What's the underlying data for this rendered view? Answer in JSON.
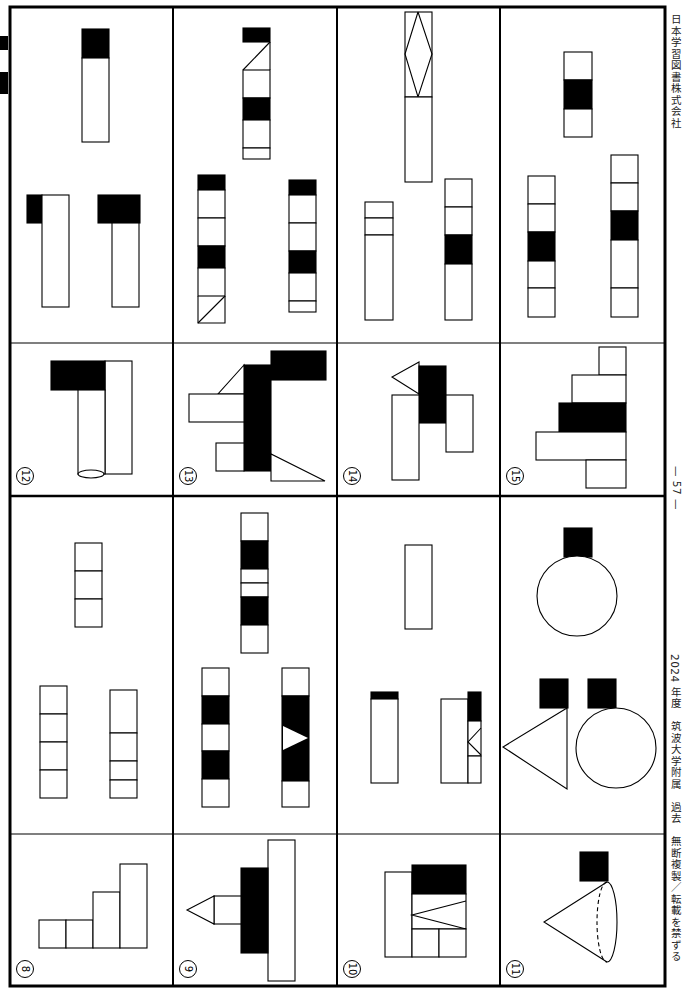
{
  "page": {
    "publisher": "日本学習図書株式会社",
    "page_number": "— 57 —",
    "footer": "2024 年度　筑波大学附属　過去　無断複製／転載を禁ずる",
    "orientation": "rotated 90deg clockwise"
  },
  "colors": {
    "ink": "#000000",
    "paper": "#ffffff",
    "text": "#222222"
  },
  "frame": {
    "x": 10,
    "y": 7,
    "w": 655,
    "h": 979,
    "border": 3
  },
  "grid": {
    "column_dividers_x": [
      173,
      337,
      500
    ],
    "mid_divider_y": 496,
    "sub_dividers": [
      {
        "y": 343,
        "x1": 10,
        "x2": 665
      },
      {
        "y": 834,
        "x1": 10,
        "x2": 665
      }
    ]
  },
  "problems": [
    {
      "number": "⑧",
      "label_x": 16,
      "label_y": 960
    },
    {
      "number": "⑨",
      "label_x": 179,
      "label_y": 960
    },
    {
      "number": "⑩",
      "label_x": 343,
      "label_y": 960
    },
    {
      "number": "⑪",
      "label_x": 506,
      "label_y": 960
    },
    {
      "number": "⑫",
      "label_x": 16,
      "label_y": 467
    },
    {
      "number": "⑬",
      "label_x": 179,
      "label_y": 467
    },
    {
      "number": "⑭",
      "label_x": 343,
      "label_y": 467
    },
    {
      "number": "⑮",
      "label_x": 506,
      "label_y": 467
    }
  ],
  "shapes": [
    {
      "t": "rect",
      "x": 39,
      "y": 920,
      "w": 27,
      "h": 28,
      "f": 0
    },
    {
      "t": "rect",
      "x": 66,
      "y": 920,
      "w": 27,
      "h": 28,
      "f": 0
    },
    {
      "t": "rect",
      "x": 93,
      "y": 892,
      "w": 27,
      "h": 56,
      "f": 0
    },
    {
      "t": "rect",
      "x": 120,
      "y": 864,
      "w": 27,
      "h": 84,
      "f": 0
    },
    {
      "t": "rect",
      "x": 75,
      "y": 543,
      "w": 27,
      "h": 28,
      "f": 0
    },
    {
      "t": "rect",
      "x": 75,
      "y": 571,
      "w": 27,
      "h": 28,
      "f": 0
    },
    {
      "t": "rect",
      "x": 75,
      "y": 599,
      "w": 27,
      "h": 28,
      "f": 0
    },
    {
      "t": "rect",
      "x": 40,
      "y": 686,
      "w": 27,
      "h": 28,
      "f": 0
    },
    {
      "t": "rect",
      "x": 40,
      "y": 714,
      "w": 27,
      "h": 28,
      "f": 0
    },
    {
      "t": "rect",
      "x": 40,
      "y": 742,
      "w": 27,
      "h": 28,
      "f": 0
    },
    {
      "t": "rect",
      "x": 40,
      "y": 770,
      "w": 27,
      "h": 28,
      "f": 0
    },
    {
      "t": "rect",
      "x": 110,
      "y": 690,
      "w": 27,
      "h": 43,
      "f": 0
    },
    {
      "t": "rect",
      "x": 110,
      "y": 733,
      "w": 27,
      "h": 28,
      "f": 0
    },
    {
      "t": "rect",
      "x": 110,
      "y": 761,
      "w": 27,
      "h": 19,
      "f": 0
    },
    {
      "t": "rect",
      "x": 110,
      "y": 780,
      "w": 27,
      "h": 18,
      "f": 0
    },
    {
      "t": "rect",
      "x": 268,
      "y": 840,
      "w": 27,
      "h": 141,
      "f": 0
    },
    {
      "t": "rect",
      "x": 241,
      "y": 868,
      "w": 27,
      "h": 85,
      "f": 1
    },
    {
      "t": "rect",
      "x": 214,
      "y": 896,
      "w": 27,
      "h": 28,
      "f": 0
    },
    {
      "t": "poly",
      "p": "214,896 187,910 214,924",
      "f": 0
    },
    {
      "t": "rect",
      "x": 241,
      "y": 513,
      "w": 27,
      "h": 28,
      "f": 0
    },
    {
      "t": "rect",
      "x": 241,
      "y": 541,
      "w": 27,
      "h": 28,
      "f": 1
    },
    {
      "t": "rect",
      "x": 241,
      "y": 569,
      "w": 27,
      "h": 14,
      "f": 0
    },
    {
      "t": "rect",
      "x": 241,
      "y": 583,
      "w": 27,
      "h": 14,
      "f": 0
    },
    {
      "t": "rect",
      "x": 241,
      "y": 597,
      "w": 27,
      "h": 28,
      "f": 1
    },
    {
      "t": "rect",
      "x": 241,
      "y": 625,
      "w": 27,
      "h": 28,
      "f": 0
    },
    {
      "t": "rect",
      "x": 202,
      "y": 668,
      "w": 27,
      "h": 28,
      "f": 0
    },
    {
      "t": "rect",
      "x": 202,
      "y": 696,
      "w": 27,
      "h": 28,
      "f": 1
    },
    {
      "t": "rect",
      "x": 202,
      "y": 724,
      "w": 27,
      "h": 27,
      "f": 0
    },
    {
      "t": "rect",
      "x": 202,
      "y": 751,
      "w": 27,
      "h": 28,
      "f": 1
    },
    {
      "t": "rect",
      "x": 202,
      "y": 779,
      "w": 27,
      "h": 28,
      "f": 0
    },
    {
      "t": "rect",
      "x": 282,
      "y": 668,
      "w": 27,
      "h": 28,
      "f": 0
    },
    {
      "t": "rect",
      "x": 282,
      "y": 696,
      "w": 27,
      "h": 85,
      "f": 1
    },
    {
      "t": "poly",
      "p": "283,726 308,738 283,750",
      "f": 2
    },
    {
      "t": "rect",
      "x": 282,
      "y": 781,
      "w": 27,
      "h": 26,
      "f": 0
    },
    {
      "t": "rect",
      "x": 405,
      "y": 545,
      "w": 27,
      "h": 84,
      "f": 0
    },
    {
      "t": "rect",
      "x": 371,
      "y": 692,
      "w": 27,
      "h": 7,
      "f": 1
    },
    {
      "t": "rect",
      "x": 371,
      "y": 699,
      "w": 27,
      "h": 84,
      "f": 0
    },
    {
      "t": "rect",
      "x": 441,
      "y": 699,
      "w": 27,
      "h": 84,
      "f": 0
    },
    {
      "t": "rect",
      "x": 468,
      "y": 692,
      "w": 13,
      "h": 29,
      "f": 1
    },
    {
      "t": "rect",
      "x": 468,
      "y": 721,
      "w": 13,
      "h": 35,
      "f": 0
    },
    {
      "t": "line",
      "p": "481,728 468,742 481,755"
    },
    {
      "t": "rect",
      "x": 468,
      "y": 756,
      "w": 13,
      "h": 27,
      "f": 0
    },
    {
      "t": "rect",
      "x": 385,
      "y": 872,
      "w": 27,
      "h": 85,
      "f": 0
    },
    {
      "t": "rect",
      "x": 412,
      "y": 865,
      "w": 54,
      "h": 29,
      "f": 1
    },
    {
      "t": "rect",
      "x": 412,
      "y": 894,
      "w": 54,
      "h": 35,
      "f": 0
    },
    {
      "t": "line",
      "p": "466,901 412,915 466,929"
    },
    {
      "t": "rect",
      "x": 412,
      "y": 929,
      "w": 27,
      "h": 28,
      "f": 0
    },
    {
      "t": "rect",
      "x": 439,
      "y": 929,
      "w": 27,
      "h": 28,
      "f": 0
    },
    {
      "t": "rect",
      "x": 564,
      "y": 528,
      "w": 28,
      "h": 29,
      "f": 1
    },
    {
      "t": "circle",
      "cx": 577,
      "cy": 596,
      "r": 40,
      "f": 0
    },
    {
      "t": "rect",
      "x": 540,
      "y": 679,
      "w": 28,
      "h": 29,
      "f": 1
    },
    {
      "t": "rect",
      "x": 588,
      "y": 679,
      "w": 28,
      "h": 29,
      "f": 1
    },
    {
      "t": "poly",
      "p": "567,708 503,747 567,789",
      "f": 0
    },
    {
      "t": "circle",
      "cx": 616,
      "cy": 748,
      "r": 40,
      "f": 0
    },
    {
      "t": "rect",
      "x": 580,
      "y": 852,
      "w": 28,
      "h": 29,
      "f": 1
    },
    {
      "t": "cone",
      "apex": "544,922",
      "top": "607,882",
      "bottom": "607,962",
      "rx": 10
    },
    {
      "t": "rect",
      "x": 82,
      "y": 29,
      "w": 27,
      "h": 29,
      "f": 1
    },
    {
      "t": "rect",
      "x": 82,
      "y": 58,
      "w": 27,
      "h": 84,
      "f": 0
    },
    {
      "t": "rect",
      "x": 27,
      "y": 195,
      "w": 15,
      "h": 28,
      "f": 1
    },
    {
      "t": "rect",
      "x": 42,
      "y": 195,
      "w": 27,
      "h": 112,
      "f": 0
    },
    {
      "t": "rect",
      "x": 98,
      "y": 195,
      "w": 42,
      "h": 28,
      "f": 1
    },
    {
      "t": "rect",
      "x": 112,
      "y": 223,
      "w": 27,
      "h": 84,
      "f": 0
    },
    {
      "t": "rect",
      "x": 105,
      "y": 361,
      "w": 27,
      "h": 113,
      "f": 0
    },
    {
      "t": "rect",
      "x": 51,
      "y": 361,
      "w": 54,
      "h": 29,
      "f": 1
    },
    {
      "t": "rect",
      "x": 78,
      "y": 390,
      "w": 27,
      "h": 84,
      "f": 0
    },
    {
      "t": "ellipse",
      "cx": 91,
      "cy": 474,
      "rx": 13,
      "ry": 4
    },
    {
      "t": "rect",
      "x": 243,
      "y": 28,
      "w": 27,
      "h": 14,
      "f": 1
    },
    {
      "t": "line",
      "p": "270,42 243,70"
    },
    {
      "t": "line",
      "p": "270,42 270,70"
    },
    {
      "t": "rect",
      "x": 243,
      "y": 70,
      "w": 27,
      "h": 28,
      "f": 0
    },
    {
      "t": "rect",
      "x": 243,
      "y": 98,
      "w": 27,
      "h": 22,
      "f": 1
    },
    {
      "t": "rect",
      "x": 243,
      "y": 120,
      "w": 27,
      "h": 28,
      "f": 0
    },
    {
      "t": "rect",
      "x": 243,
      "y": 148,
      "w": 27,
      "h": 11,
      "f": 0
    },
    {
      "t": "rect",
      "x": 198,
      "y": 175,
      "w": 27,
      "h": 15,
      "f": 1
    },
    {
      "t": "rect",
      "x": 198,
      "y": 190,
      "w": 27,
      "h": 28,
      "f": 0
    },
    {
      "t": "rect",
      "x": 198,
      "y": 218,
      "w": 27,
      "h": 28,
      "f": 0
    },
    {
      "t": "rect",
      "x": 198,
      "y": 246,
      "w": 27,
      "h": 22,
      "f": 1
    },
    {
      "t": "rect",
      "x": 198,
      "y": 268,
      "w": 27,
      "h": 28,
      "f": 0
    },
    {
      "t": "line",
      "p": "198,296 198,323 225,323 225,296"
    },
    {
      "t": "line",
      "p": "198,323 225,296"
    },
    {
      "t": "rect",
      "x": 289,
      "y": 180,
      "w": 27,
      "h": 15,
      "f": 1
    },
    {
      "t": "rect",
      "x": 289,
      "y": 195,
      "w": 27,
      "h": 28,
      "f": 0
    },
    {
      "t": "rect",
      "x": 289,
      "y": 223,
      "w": 27,
      "h": 28,
      "f": 0
    },
    {
      "t": "rect",
      "x": 289,
      "y": 251,
      "w": 27,
      "h": 22,
      "f": 1
    },
    {
      "t": "rect",
      "x": 289,
      "y": 273,
      "w": 27,
      "h": 28,
      "f": 0
    },
    {
      "t": "rect",
      "x": 289,
      "y": 301,
      "w": 27,
      "h": 11,
      "f": 0
    },
    {
      "t": "rect",
      "x": 271,
      "y": 351,
      "w": 55,
      "h": 29,
      "f": 1
    },
    {
      "t": "rect",
      "x": 244,
      "y": 365,
      "w": 27,
      "h": 106,
      "f": 1
    },
    {
      "t": "poly",
      "p": "244,365 218,394 244,394",
      "f": 0
    },
    {
      "t": "rect",
      "x": 189,
      "y": 394,
      "w": 55,
      "h": 28,
      "f": 0
    },
    {
      "t": "rect",
      "x": 216,
      "y": 443,
      "w": 28,
      "h": 28,
      "f": 0
    },
    {
      "t": "poly",
      "p": "271,454 271,481 325,481",
      "f": 0
    },
    {
      "t": "rect",
      "x": 405,
      "y": 12,
      "w": 27,
      "h": 85,
      "f": 0
    },
    {
      "t": "line",
      "p": "418,12 405,54 418,97 432,54 418,12"
    },
    {
      "t": "rect",
      "x": 405,
      "y": 97,
      "w": 27,
      "h": 85,
      "f": 0
    },
    {
      "t": "rect",
      "x": 365,
      "y": 202,
      "w": 28,
      "h": 16,
      "f": 0
    },
    {
      "t": "rect",
      "x": 365,
      "y": 218,
      "w": 28,
      "h": 17,
      "f": 0
    },
    {
      "t": "rect",
      "x": 365,
      "y": 235,
      "w": 28,
      "h": 85,
      "f": 0
    },
    {
      "t": "rect",
      "x": 445,
      "y": 179,
      "w": 27,
      "h": 28,
      "f": 0
    },
    {
      "t": "rect",
      "x": 445,
      "y": 207,
      "w": 27,
      "h": 28,
      "f": 0
    },
    {
      "t": "rect",
      "x": 445,
      "y": 235,
      "w": 27,
      "h": 29,
      "f": 1
    },
    {
      "t": "rect",
      "x": 445,
      "y": 264,
      "w": 27,
      "h": 56,
      "f": 0
    },
    {
      "t": "poly",
      "p": "419,362 392,377 419,394",
      "f": 0
    },
    {
      "t": "rect",
      "x": 419,
      "y": 366,
      "w": 27,
      "h": 57,
      "f": 1
    },
    {
      "t": "rect",
      "x": 392,
      "y": 395,
      "w": 27,
      "h": 85,
      "f": 0
    },
    {
      "t": "rect",
      "x": 446,
      "y": 395,
      "w": 27,
      "h": 57,
      "f": 0
    },
    {
      "t": "rect",
      "x": 564,
      "y": 52,
      "w": 28,
      "h": 28,
      "f": 0
    },
    {
      "t": "rect",
      "x": 564,
      "y": 80,
      "w": 28,
      "h": 29,
      "f": 1
    },
    {
      "t": "rect",
      "x": 564,
      "y": 109,
      "w": 28,
      "h": 28,
      "f": 0
    },
    {
      "t": "rect",
      "x": 528,
      "y": 176,
      "w": 27,
      "h": 28,
      "f": 0
    },
    {
      "t": "rect",
      "x": 528,
      "y": 204,
      "w": 27,
      "h": 28,
      "f": 0
    },
    {
      "t": "rect",
      "x": 528,
      "y": 232,
      "w": 27,
      "h": 29,
      "f": 1
    },
    {
      "t": "rect",
      "x": 528,
      "y": 261,
      "w": 27,
      "h": 27,
      "f": 0
    },
    {
      "t": "rect",
      "x": 528,
      "y": 288,
      "w": 27,
      "h": 29,
      "f": 0
    },
    {
      "t": "rect",
      "x": 611,
      "y": 155,
      "w": 27,
      "h": 28,
      "f": 0
    },
    {
      "t": "rect",
      "x": 611,
      "y": 183,
      "w": 27,
      "h": 28,
      "f": 0
    },
    {
      "t": "rect",
      "x": 611,
      "y": 211,
      "w": 27,
      "h": 29,
      "f": 1
    },
    {
      "t": "rect",
      "x": 611,
      "y": 240,
      "w": 27,
      "h": 48,
      "f": 0
    },
    {
      "t": "rect",
      "x": 611,
      "y": 288,
      "w": 27,
      "h": 29,
      "f": 0
    },
    {
      "t": "rect",
      "x": 599,
      "y": 347,
      "w": 27,
      "h": 28,
      "f": 0
    },
    {
      "t": "rect",
      "x": 572,
      "y": 375,
      "w": 54,
      "h": 28,
      "f": 0
    },
    {
      "t": "rect",
      "x": 559,
      "y": 403,
      "w": 67,
      "h": 29,
      "f": 1
    },
    {
      "t": "rect",
      "x": 536,
      "y": 432,
      "w": 90,
      "h": 28,
      "f": 0
    },
    {
      "t": "rect",
      "x": 586,
      "y": 460,
      "w": 40,
      "h": 28,
      "f": 0
    }
  ]
}
